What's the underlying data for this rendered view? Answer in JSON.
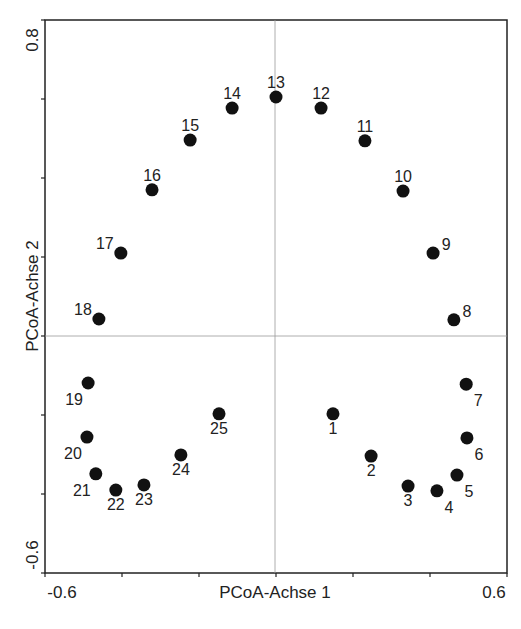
{
  "chart_data": {
    "type": "scatter",
    "title": "",
    "xlabel": "PCoA-Achse 1",
    "ylabel": "PCoA-Achse 2",
    "xlim": [
      -0.6,
      0.6
    ],
    "ylim": [
      -0.6,
      0.8
    ],
    "x_tick_labels": [
      "-0.6",
      "0.6"
    ],
    "y_tick_labels": [
      "0.8",
      "-0.6"
    ],
    "x_ticks": [
      -0.6,
      -0.4,
      -0.2,
      0.0,
      0.2,
      0.4,
      0.6
    ],
    "y_ticks": [
      0.8,
      0.6,
      0.4,
      0.2,
      0.0,
      -0.2,
      -0.4,
      -0.6
    ],
    "grid": false,
    "reference_lines": {
      "x": 0,
      "y": 0
    },
    "legend": null,
    "marker_color": "#111111",
    "points": [
      {
        "label": "1",
        "x": 0.148,
        "y": -0.197,
        "label_pos": "below"
      },
      {
        "label": "2",
        "x": 0.247,
        "y": -0.304,
        "label_pos": "below"
      },
      {
        "label": "3",
        "x": 0.343,
        "y": -0.38,
        "label_pos": "below"
      },
      {
        "label": "4",
        "x": 0.418,
        "y": -0.392,
        "label_pos": "below-right"
      },
      {
        "label": "5",
        "x": 0.47,
        "y": -0.352,
        "label_pos": "below-right"
      },
      {
        "label": "6",
        "x": 0.496,
        "y": -0.258,
        "label_pos": "below-right"
      },
      {
        "label": "7",
        "x": 0.494,
        "y": -0.122,
        "label_pos": "below-right"
      },
      {
        "label": "8",
        "x": 0.462,
        "y": 0.041,
        "label_pos": "above-right"
      },
      {
        "label": "9",
        "x": 0.408,
        "y": 0.21,
        "label_pos": "above-right"
      },
      {
        "label": "10",
        "x": 0.33,
        "y": 0.367,
        "label_pos": "above"
      },
      {
        "label": "11",
        "x": 0.231,
        "y": 0.494,
        "label_pos": "above"
      },
      {
        "label": "12",
        "x": 0.117,
        "y": 0.577,
        "label_pos": "above"
      },
      {
        "label": "13",
        "x": 0.0,
        "y": 0.605,
        "label_pos": "above"
      },
      {
        "label": "14",
        "x": -0.114,
        "y": 0.577,
        "label_pos": "above"
      },
      {
        "label": "15",
        "x": -0.223,
        "y": 0.496,
        "label_pos": "above"
      },
      {
        "label": "16",
        "x": -0.322,
        "y": 0.37,
        "label_pos": "above"
      },
      {
        "label": "17",
        "x": -0.403,
        "y": 0.21,
        "label_pos": "above-left"
      },
      {
        "label": "18",
        "x": -0.46,
        "y": 0.043,
        "label_pos": "above-left"
      },
      {
        "label": "19",
        "x": -0.488,
        "y": -0.119,
        "label_pos": "below-left"
      },
      {
        "label": "20",
        "x": -0.491,
        "y": -0.256,
        "label_pos": "below-left"
      },
      {
        "label": "21",
        "x": -0.468,
        "y": -0.349,
        "label_pos": "below-left"
      },
      {
        "label": "22",
        "x": -0.416,
        "y": -0.39,
        "label_pos": "below"
      },
      {
        "label": "23",
        "x": -0.343,
        "y": -0.377,
        "label_pos": "below"
      },
      {
        "label": "24",
        "x": -0.247,
        "y": -0.301,
        "label_pos": "below"
      },
      {
        "label": "25",
        "x": -0.148,
        "y": -0.197,
        "label_pos": "below"
      }
    ]
  }
}
